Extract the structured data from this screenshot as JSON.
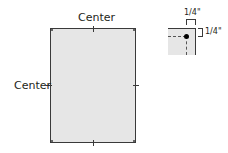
{
  "main_diagram": {
    "top_label": "Center",
    "left_label": "Center",
    "page_fill": "#e6e6e6",
    "stroke_color": "#3a3a3a"
  },
  "inset_diagram": {
    "top_measure_label": "1/4\"",
    "right_measure_label": "1/4\"",
    "pin_icon": "corner-hole-dot"
  }
}
